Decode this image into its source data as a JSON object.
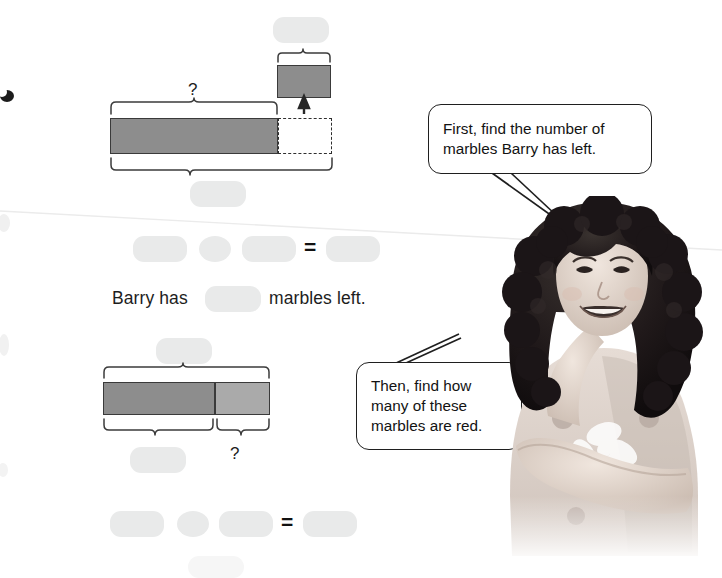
{
  "page": {
    "background": "#ffffff",
    "bar_dark_color": "#8d8d8d",
    "bar_light_color": "#aaaaaa",
    "bar_border_color": "#3a3a3a",
    "blank_fill_color": "#e9eaea",
    "ink_color": "#1d1d1d"
  },
  "model_one": {
    "question_mark": "?",
    "top_blank_label": "",
    "bottom_blank_label": "",
    "small_bar_blank_label": "",
    "bars": {
      "long_bar_value": "",
      "dashed_bar_value": "",
      "small_bar_value": ""
    }
  },
  "equation_one": {
    "operand_a": "",
    "operator": "",
    "operand_b": "",
    "equals_sign": "=",
    "result": ""
  },
  "sentence_one": {
    "before": "Barry has",
    "blank": "",
    "after": "marbles left."
  },
  "model_two": {
    "question_mark": "?",
    "top_blank_label": "",
    "bottom_blank_label": "",
    "segments": {
      "left_value": "",
      "right_value": ""
    }
  },
  "equation_two": {
    "operand_a": "",
    "operator": "",
    "operand_b": "",
    "equals_sign": "=",
    "result": ""
  },
  "speech_bubbles": [
    {
      "id": "bubble-first",
      "line_1": "First, find the number of",
      "line_2": "marbles Barry has left."
    },
    {
      "id": "bubble-then",
      "line_1": "Then, find how",
      "line_2": "many of these",
      "line_3": "marbles are red."
    }
  ],
  "illustration": {
    "alt": "smiling girl with curly dark hair pointing upward, arms crossed"
  }
}
